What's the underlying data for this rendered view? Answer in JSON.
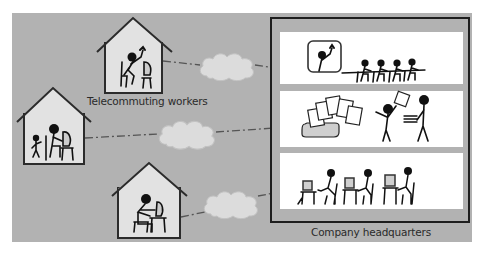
{
  "diagram": {
    "type": "illustration",
    "title": "",
    "colors": {
      "background": "#ffffff",
      "panel": "#b2b2b2",
      "house_fill": "#e2e2e2",
      "house_stroke": "#2b2b2b",
      "cloud_fill": "#dcdcdc",
      "cloud_stroke": "#c4c4c4",
      "hq_frame": "#1e1e1e",
      "room_fill": "#ffffff",
      "figure": "#111111",
      "link_line": "#555555"
    },
    "labels": {
      "telecommuting": "Telecommuting workers",
      "headquarters": "Company headquarters"
    },
    "nodes": [
      {
        "id": "house-1",
        "kind": "home",
        "scene": "worker waving at computer"
      },
      {
        "id": "house-2",
        "kind": "home",
        "scene": "worker at computer with child"
      },
      {
        "id": "house-3",
        "kind": "home",
        "scene": "worker typing at computer"
      },
      {
        "id": "cloud-1",
        "kind": "network"
      },
      {
        "id": "cloud-2",
        "kind": "network"
      },
      {
        "id": "cloud-3",
        "kind": "network"
      },
      {
        "id": "hq-room-meeting",
        "kind": "headquarters-room",
        "scene": "video conference with remote worker on screen and four seated attendees"
      },
      {
        "id": "hq-room-documents",
        "kind": "headquarters-room",
        "scene": "printer outputting documents shared between two people"
      },
      {
        "id": "hq-room-desks",
        "kind": "headquarters-room",
        "scene": "three workers at desktop computers"
      }
    ],
    "edges": [
      {
        "from": "house-1",
        "to": "cloud-1"
      },
      {
        "from": "cloud-1",
        "to": "hq-room-meeting"
      },
      {
        "from": "house-2",
        "to": "cloud-2"
      },
      {
        "from": "cloud-2",
        "to": "hq-room-documents"
      },
      {
        "from": "house-3",
        "to": "cloud-3"
      },
      {
        "from": "cloud-3",
        "to": "hq-room-desks"
      }
    ]
  }
}
